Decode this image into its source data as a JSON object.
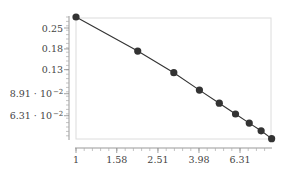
{
  "chart_data": {
    "type": "line",
    "title": "",
    "xlabel": "",
    "ylabel": "",
    "x_scale": "log",
    "y_scale": "log",
    "grid": false,
    "legend": null,
    "x": [
      1,
      2,
      3,
      4,
      5,
      6,
      7,
      8,
      9
    ],
    "series": [
      {
        "name": "",
        "values": [
          0.297,
          0.174,
          0.124,
          0.0943,
          0.0768,
          0.0648,
          0.0562,
          0.0498,
          0.044
        ],
        "color": "#333333",
        "marker": "circle"
      }
    ],
    "x_ticks": [
      {
        "value": 1,
        "label": "1"
      },
      {
        "value": 1.58,
        "label": "1.58"
      },
      {
        "value": 2.51,
        "label": "2.51"
      },
      {
        "value": 3.98,
        "label": "3.98"
      },
      {
        "value": 6.31,
        "label": "6.31"
      }
    ],
    "y_ticks": [
      {
        "value": 0.25,
        "label": "0.25"
      },
      {
        "value": 0.18,
        "label": "0.18"
      },
      {
        "value": 0.13,
        "label": "0.13"
      },
      {
        "value": 0.0891,
        "label": "8.91 · 10",
        "exp": "−2"
      },
      {
        "value": 0.0631,
        "label": "6.31 · 10",
        "exp": "−2"
      }
    ],
    "xlim": [
      1,
      9
    ],
    "ylim": [
      0.044,
      0.297
    ]
  }
}
